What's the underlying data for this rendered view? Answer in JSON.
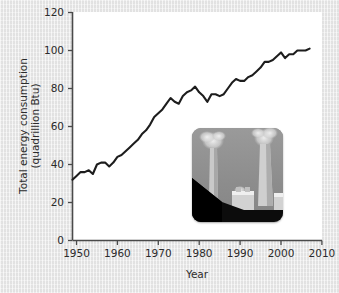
{
  "figure": {
    "background_color": "#e9e9e9",
    "plot_background_color": "#ffffff",
    "line_color": "#1d1d1d",
    "axis_color": "#4a4a4a"
  },
  "axes": {
    "x_title": "Year",
    "y_title_line1": "Total energy consumption",
    "y_title_line2": "(quadrillion Btu)",
    "x_ticks": [
      "1950",
      "1960",
      "1970",
      "1980",
      "1990",
      "2000",
      "2010"
    ],
    "y_ticks": [
      "0",
      "20",
      "40",
      "60",
      "80",
      "100",
      "120"
    ]
  },
  "inset": {
    "name": "power-plant-photograph",
    "description": "Grayscale photo of a coal power plant with two smokestacks emitting smoke over a dark coal pile"
  },
  "chart_data": {
    "type": "line",
    "title": "",
    "xlabel": "Year",
    "ylabel": "Total energy consumption (quadrillion Btu)",
    "xlim": [
      1949,
      2010
    ],
    "ylim": [
      0,
      120
    ],
    "grid": false,
    "legend": null,
    "x_ticks": [
      1950,
      1960,
      1970,
      1980,
      1990,
      2000,
      2010
    ],
    "y_ticks": [
      0,
      20,
      40,
      60,
      80,
      100,
      120
    ],
    "series": [
      {
        "name": "Total energy consumption",
        "units": "quadrillion Btu",
        "x": [
          1949,
          1950,
          1951,
          1952,
          1953,
          1954,
          1955,
          1956,
          1957,
          1958,
          1959,
          1960,
          1961,
          1962,
          1963,
          1964,
          1965,
          1966,
          1967,
          1968,
          1969,
          1970,
          1971,
          1972,
          1973,
          1974,
          1975,
          1976,
          1977,
          1978,
          1979,
          1980,
          1981,
          1982,
          1983,
          1984,
          1985,
          1986,
          1987,
          1988,
          1989,
          1990,
          1991,
          1992,
          1993,
          1994,
          1995,
          1996,
          1997,
          1998,
          1999,
          2000,
          2001,
          2002,
          2003,
          2004,
          2005,
          2006,
          2007
        ],
        "values": [
          32,
          34,
          36,
          36,
          37,
          35,
          40,
          41,
          41,
          39,
          41,
          44,
          45,
          47,
          49,
          51,
          53,
          56,
          58,
          61,
          65,
          67,
          69,
          72,
          75,
          73,
          72,
          76,
          78,
          79,
          81,
          78,
          76,
          73,
          77,
          77,
          76,
          77,
          80,
          83,
          85,
          84,
          84,
          86,
          87,
          89,
          91,
          94,
          94,
          95,
          97,
          99,
          96,
          98,
          98,
          100,
          100,
          100,
          101
        ]
      }
    ]
  }
}
